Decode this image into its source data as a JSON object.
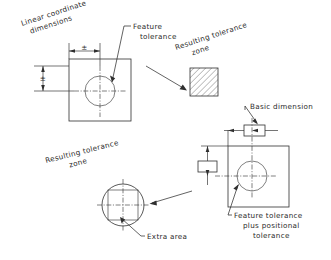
{
  "document": {
    "kind": "engineering-drawing",
    "title": "Linear coordinate dimensions versus positional tolerance",
    "background_color": "#ffffff",
    "line_color": "#2f2f2f",
    "text_color": "#2a2a2a"
  },
  "labels": {
    "linear_coordinate_dimensions": {
      "line1": "Linear coordinate",
      "line2": "dimensions",
      "rotation_deg": -18
    },
    "feature_tolerance": {
      "line1": "Feature",
      "line2": "tolerance"
    },
    "resulting_tolerance_zone_top": {
      "line1": "Resulting tolerance",
      "line2": "zone",
      "rotation_deg": -18
    },
    "basic_dimension": {
      "line1": "Basic dimension"
    },
    "resulting_tolerance_zone_bottom": {
      "line1": "Resulting tolerance",
      "line2": "zone",
      "rotation_deg": -14
    },
    "extra_area": {
      "line1": "Extra area"
    },
    "feature_plus_positional": {
      "line1": "Feature tolerance",
      "line2": "plus positional",
      "line3": "tolerance"
    }
  },
  "symbols": {
    "plus_minus": "±",
    "horizontal_dimension_value": "±",
    "vertical_dimension_value": "±"
  },
  "figures": {
    "part_coordinate": {
      "name": "square part with hole, coordinate dimensioned",
      "square": {
        "x": 69,
        "y": 59,
        "w": 62,
        "h": 62
      },
      "circle": {
        "cx": 100,
        "cy": 91,
        "r": 15
      }
    },
    "tolerance_zone_square": {
      "name": "hatched square tolerance zone",
      "square": {
        "x": 190,
        "y": 68,
        "w": 28,
        "h": 28
      },
      "hatch_angle_deg": 45
    },
    "part_positional": {
      "name": "square part with hole, positional dimensioned",
      "square": {
        "x": 228,
        "y": 146,
        "w": 61,
        "h": 61
      },
      "circle": {
        "cx": 252,
        "cy": 176,
        "r": 15
      }
    },
    "tolerance_zone_circle": {
      "name": "circular tolerance zone with inscribed square showing extra area",
      "circle": {
        "cx": 123,
        "cy": 205,
        "r": 21
      },
      "inscribed_square": {
        "x": 108,
        "y": 190,
        "w": 30,
        "h": 30
      }
    },
    "basic_dimension_box_horizontal": {
      "x": 244,
      "y": 125,
      "w": 21,
      "h": 11
    },
    "basic_dimension_box_vertical": {
      "x": 198,
      "y": 161,
      "w": 19,
      "h": 11
    }
  }
}
